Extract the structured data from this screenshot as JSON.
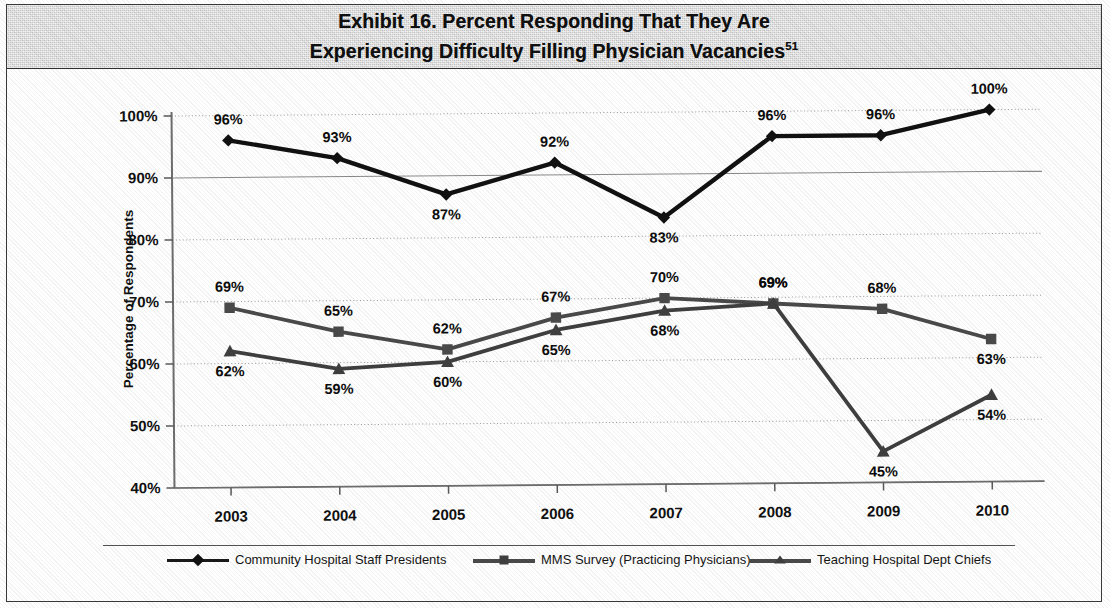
{
  "exhibit": {
    "title_line1": "Exhibit 16. Percent Responding That They Are",
    "title_line2": "Experiencing Difficulty Filling Physician Vacancies",
    "title_footnote": "51"
  },
  "chart_data": {
    "type": "line",
    "title": "Exhibit 16. Percent Responding That They Are Experiencing Difficulty Filling Physician Vacancies",
    "xlabel": "",
    "ylabel": "Percentage of Respondents",
    "categories": [
      "2003",
      "2004",
      "2005",
      "2006",
      "2007",
      "2008",
      "2009",
      "2010"
    ],
    "ylim": [
      40,
      100
    ],
    "yticks": [
      "40%",
      "50%",
      "60%",
      "70%",
      "80%",
      "90%",
      "100%"
    ],
    "ytick_values": [
      40,
      50,
      60,
      70,
      80,
      90,
      100
    ],
    "grid": true,
    "legend_position": "bottom",
    "value_suffix": "%",
    "series": [
      {
        "name": "Community Hospital Staff Presidents",
        "marker": "diamond",
        "color": "#111111",
        "values": [
          96,
          93,
          87,
          92,
          83,
          96,
          96,
          100
        ],
        "labels": [
          "96%",
          "93%",
          "87%",
          "92%",
          "83%",
          "96%",
          "96%",
          "100%"
        ]
      },
      {
        "name": "MMS Survey (Practicing Physicians)",
        "marker": "square",
        "color": "#4a4a4a",
        "values": [
          69,
          65,
          62,
          67,
          70,
          69,
          68,
          63
        ],
        "labels": [
          "69%",
          "65%",
          "62%",
          "67%",
          "70%",
          "69%",
          "68%",
          "63%"
        ]
      },
      {
        "name": "Teaching Hospital Dept Chiefs",
        "marker": "triangle",
        "color": "#3f3f3f",
        "values": [
          62,
          59,
          60,
          65,
          68,
          69,
          45,
          54
        ],
        "labels": [
          "62%",
          "59%",
          "60%",
          "65%",
          "68%",
          "69%",
          "45%",
          "54%"
        ]
      }
    ]
  },
  "legend": {
    "items": [
      {
        "label": "Community Hospital Staff Presidents",
        "marker": "diamond"
      },
      {
        "label": "MMS Survey (Practicing Physicians)",
        "marker": "square"
      },
      {
        "label": "Teaching Hospital Dept Chiefs",
        "marker": "triangle"
      }
    ]
  }
}
